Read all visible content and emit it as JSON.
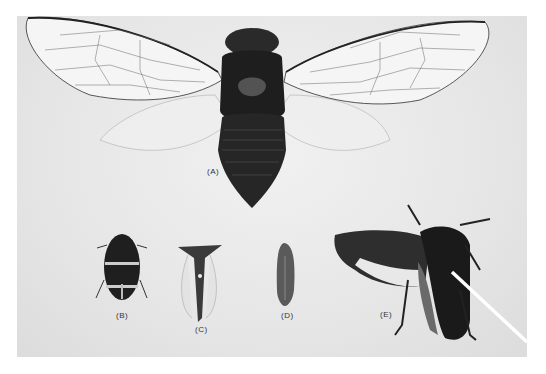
{
  "figure": {
    "specimens": [
      {
        "id": "A",
        "label": "(A)"
      },
      {
        "id": "B",
        "label": "(B)"
      },
      {
        "id": "C",
        "label": "(C)"
      },
      {
        "id": "D",
        "label": "(D)"
      },
      {
        "id": "E",
        "label": "(E)"
      }
    ]
  }
}
